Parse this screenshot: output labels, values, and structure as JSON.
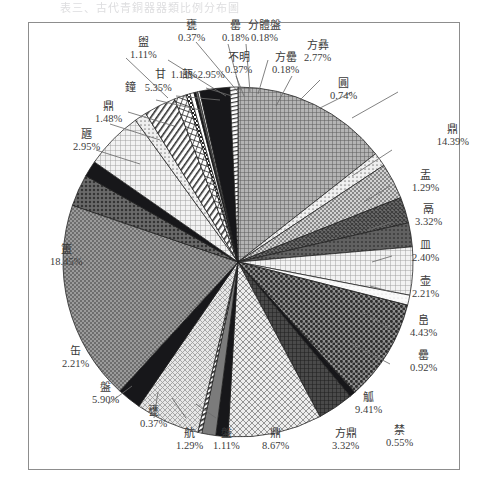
{
  "page": {
    "title_faint": "表三、古代青銅器器類比例分布圖"
  },
  "chart_data": {
    "type": "pie",
    "title": "",
    "xlabel": "",
    "ylabel": "",
    "legend": "none",
    "grid": false,
    "units": "%",
    "start_angle_deg": -90,
    "direction": "clockwise",
    "categories": [
      "鼎",
      "盂",
      "鬲",
      "簠",
      "簋",
      "敦",
      "罍",
      "酢",
      "爵",
      "觚",
      "禁",
      "方鼎",
      "鼎",
      "觚",
      "舫",
      "铪",
      "盘",
      "缶",
      "甅",
      "甘",
      "鐘",
      "彝",
      "敦",
      "甘",
      "銘",
      "方彝",
      "不明",
      "方罍",
      "分體盤",
      "罍",
      "盥",
      "方彝",
      "圓"
    ],
    "slices": [
      {
        "label": "鼎",
        "value": 14.39,
        "pattern": "fine-grid",
        "label_pos": "right-upper"
      },
      {
        "label": "盂",
        "value": 1.29,
        "pattern": "light-dot",
        "label_pos": "right"
      },
      {
        "label": "鬲",
        "value": 3.32,
        "pattern": "mid-dot",
        "label_pos": "right"
      },
      {
        "label": "皿",
        "value": 2.4,
        "pattern": "dark-weave",
        "label_pos": "right"
      },
      {
        "label": "壶",
        "value": 2.21,
        "pattern": "dark-solidish",
        "label_pos": "right"
      },
      {
        "label": "峊",
        "value": 4.43,
        "pattern": "light-grid",
        "label_pos": "right"
      },
      {
        "label": "罍",
        "value": 0.92,
        "pattern": "pale",
        "label_pos": "right-lower"
      },
      {
        "label": "觚",
        "value": 9.41,
        "pattern": "coarse-dot",
        "label_pos": "bottom-right"
      },
      {
        "label": "禁",
        "value": 0.55,
        "pattern": "black",
        "label_pos": "bottom-right"
      },
      {
        "label": "方鼎",
        "value": 3.32,
        "pattern": "dark-mesh",
        "label_pos": "bottom"
      },
      {
        "label": "鼎",
        "value": 8.67,
        "pattern": "light-diamond",
        "label_pos": "bottom"
      },
      {
        "label": "盤",
        "value": 1.11,
        "pattern": "black",
        "label_pos": "bottom"
      },
      {
        "label": "航",
        "value": 1.29,
        "pattern": "grey",
        "label_pos": "bottom"
      },
      {
        "label": "甕",
        "value": 0.37,
        "pattern": "stripe",
        "label_pos": "bottom"
      },
      {
        "label": "盤",
        "value": 5.9,
        "pattern": "light-check",
        "label_pos": "bottom-left"
      },
      {
        "label": "缶",
        "value": 2.21,
        "pattern": "black",
        "label_pos": "left-lower"
      },
      {
        "label": "簠",
        "value": 18.45,
        "pattern": "mid-dot-dense",
        "label_pos": "left"
      },
      {
        "label": "甅",
        "value": 2.95,
        "pattern": "dark-dot",
        "label_pos": "upper-left"
      },
      {
        "label": "鼎",
        "value": 1.48,
        "pattern": "black",
        "label_pos": "upper-left"
      },
      {
        "label": "鐘",
        "value": 5.35,
        "pattern": "light-grid",
        "label_pos": "upper-left"
      },
      {
        "label": "盥",
        "value": 1.11,
        "pattern": "light-dot",
        "label_pos": "top-left"
      },
      {
        "label": "瓿",
        "value": 2.95,
        "pattern": "diag-hatch",
        "label_pos": "top-left"
      },
      {
        "label": "甘",
        "value": 1.11,
        "pattern": "cross-hatch",
        "label_pos": "top-left"
      },
      {
        "label": "甕",
        "value": 0.37,
        "pattern": "check",
        "label_pos": "top"
      },
      {
        "label": "不明",
        "value": 0.37,
        "pattern": "white",
        "label_pos": "top"
      },
      {
        "label": "罍",
        "value": 0.18,
        "pattern": "black",
        "label_pos": "top"
      },
      {
        "label": "分體盤",
        "value": 0.18,
        "pattern": "grey",
        "label_pos": "top"
      },
      {
        "label": "方罍",
        "value": 0.18,
        "pattern": "white",
        "label_pos": "top-right"
      },
      {
        "label": "方彝",
        "value": 2.77,
        "pattern": "black",
        "label_pos": "top-right"
      },
      {
        "label": "圓",
        "value": 0.74,
        "pattern": "stripe-thin",
        "label_pos": "top-right"
      }
    ]
  },
  "labels": {
    "l_ding_1": {
      "name": "鼎",
      "pct": "14.39%"
    },
    "l_you": {
      "name": "盂",
      "pct": "1.29%"
    },
    "l_ge": {
      "name": "鬲",
      "pct": "3.32%"
    },
    "l_min": {
      "name": "皿",
      "pct": "2.40%"
    },
    "l_hu": {
      "name": "壶",
      "pct": "2.21%"
    },
    "l_zun": {
      "name": "峊",
      "pct": "4.43%"
    },
    "l_yi_small": {
      "name": "罍",
      "pct": "0.92%"
    },
    "l_jue": {
      "name": "觚",
      "pct": "9.41%"
    },
    "l_jin": {
      "name": "禁",
      "pct": "0.55%"
    },
    "l_fangding": {
      "name": "方鼎",
      "pct": "3.32%"
    },
    "l_ding_2": {
      "name": "鼎",
      "pct": "8.67%"
    },
    "l_pan_small": {
      "name": "盤",
      "pct": "1.11%"
    },
    "l_hang": {
      "name": "航",
      "pct": "1.29%"
    },
    "l_zhan": {
      "name": "甕",
      "pct": "0.37%"
    },
    "l_pan": {
      "name": "盤",
      "pct": "5.90%"
    },
    "l_fou": {
      "name": "缶",
      "pct": "2.21%"
    },
    "l_gui": {
      "name": "簠",
      "pct": "18.45%"
    },
    "l_yan": {
      "name": "甅",
      "pct": "2.95%"
    },
    "l_ding_3": {
      "name": "鼎",
      "pct": "1.48%"
    },
    "l_zhong": {
      "name": "鐘",
      "pct": "5.35%"
    },
    "l_he": {
      "name": "盥",
      "pct": "1.11%"
    },
    "l_zhi": {
      "name": "瓿",
      "pct": "2.95%"
    },
    "l_gan": {
      "name": "甘",
      "pct": "1.11%"
    },
    "l_zhan2": {
      "name": "甕",
      "pct": "0.37%"
    },
    "l_unknown": {
      "name": "不明",
      "pct": "0.37%"
    },
    "l_yi2": {
      "name": "罍",
      "pct": "0.18%"
    },
    "l_fenti": {
      "name": "分體盤",
      "pct": "0.18%"
    },
    "l_fangyi": {
      "name": "方罍",
      "pct": "0.18%"
    },
    "l_fangyi2": {
      "name": "方彝",
      "pct": "2.77%"
    },
    "l_yuan": {
      "name": "圓",
      "pct": "0.74%"
    }
  },
  "colors": {
    "frame": "#8d8d8d",
    "ink": "#3a3a3a",
    "leader": "#6b6b6b",
    "paper": "#ffffff"
  }
}
